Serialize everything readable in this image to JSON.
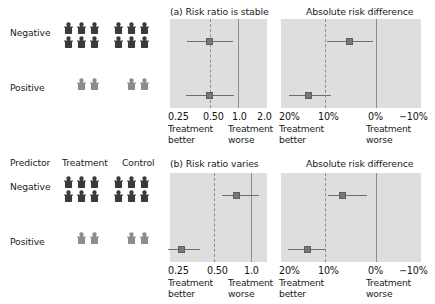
{
  "figure": {
    "icon_colors": {
      "negative": "#3a3a3a",
      "positive": "#8c8c8c"
    },
    "panel_bg": "#dedede",
    "marker_color": "#777777",
    "line_color": "#6e6e6e",
    "axis_color": "#8d8d8d"
  },
  "blocks": [
    {
      "id": "a",
      "pictogram": {
        "headers": {
          "predictor": "",
          "treatment": "",
          "control": ""
        },
        "rows": [
          {
            "label": "Negative",
            "treatment_count": 6,
            "control_count": 6,
            "tone": "negative"
          },
          {
            "label": "Positive",
            "treatment_count": 2,
            "control_count": 2,
            "tone": "positive"
          }
        ]
      },
      "charts": [
        {
          "id": "a-risk-ratio",
          "title": "(a) Risk ratio is stable",
          "ticks": [
            "0.25",
            "0.50",
            "1.0",
            "2.0"
          ],
          "footer_left": "Treatment\nbetter",
          "footer_right": "Treatment\nworse",
          "points": [
            {
              "row": "Negative",
              "estimate": 0.47,
              "low": 0.34,
              "high": 0.67
            },
            {
              "row": "Positive",
              "estimate": 0.47,
              "low": 0.33,
              "high": 0.68
            }
          ]
        },
        {
          "id": "a-risk-difference",
          "title": "Absolute risk difference",
          "ticks": [
            "20%",
            "10%",
            "0%",
            "−10%"
          ],
          "footer_left": "Treatment\nbetter",
          "footer_right": "Treatment\nworse",
          "points": [
            {
              "row": "Negative",
              "estimate": 6.0,
              "low": 10.2,
              "high": 2.2
            },
            {
              "row": "Positive",
              "estimate": 16.5,
              "low": 20.5,
              "high": 12.6
            }
          ]
        }
      ]
    },
    {
      "id": "b",
      "pictogram": {
        "headers": {
          "predictor": "Predictor",
          "treatment": "Treatment",
          "control": "Control"
        },
        "rows": [
          {
            "label": "Negative",
            "treatment_count": 6,
            "control_count": 6,
            "tone": "negative"
          },
          {
            "label": "Positive",
            "treatment_count": 2,
            "control_count": 2,
            "tone": "positive"
          }
        ]
      },
      "charts": [
        {
          "id": "b-risk-ratio",
          "title": "(b) Risk ratio varies",
          "ticks": [
            "0.25",
            "0.50",
            "1.0"
          ],
          "footer_left": "Treatment\nbetter",
          "footer_right": "Treatment\nworse",
          "points": [
            {
              "row": "Negative",
              "estimate": 0.68,
              "low": 0.5,
              "high": 1.02
            },
            {
              "row": "Positive",
              "estimate": 0.28,
              "low": 0.21,
              "high": 0.38
            }
          ]
        },
        {
          "id": "b-risk-difference",
          "title": "Absolute risk difference",
          "ticks": [
            "20%",
            "10%",
            "0%",
            "−10%"
          ],
          "footer_left": "Treatment\nbetter",
          "footer_right": "Treatment\nworse",
          "points": [
            {
              "row": "Negative",
              "estimate": 7.8,
              "low": 10.4,
              "high": 4.8
            },
            {
              "row": "Positive",
              "estimate": 16.0,
              "low": 20.6,
              "high": 10.6
            }
          ]
        }
      ]
    }
  ],
  "chart_data": {
    "type": "scatter",
    "panels": [
      {
        "panel": "a",
        "panel_title": "(a) Risk ratio is stable",
        "charts": [
          {
            "name": "Risk ratio",
            "xlabel": "Risk ratio",
            "xscale": "log",
            "xticks": [
              0.25,
              0.5,
              1.0,
              2.0
            ],
            "xticklabels": [
              "0.25",
              "0.50",
              "1.0",
              "2.0"
            ],
            "xlim": [
              0.2,
              2.5
            ],
            "reference_line": 1.0,
            "dashed_line": 0.5,
            "direction_left": "Treatment better",
            "direction_right": "Treatment worse",
            "categories": [
              "Negative",
              "Positive"
            ],
            "estimates": [
              0.47,
              0.47
            ],
            "ci_low": [
              0.34,
              0.33
            ],
            "ci_high": [
              0.67,
              0.68
            ]
          },
          {
            "name": "Absolute risk difference",
            "xlabel": "Absolute risk difference",
            "xscale": "linear-reversed",
            "xticks": [
              20,
              10,
              0,
              -10
            ],
            "xticklabels": [
              "20%",
              "10%",
              "0%",
              "−10%"
            ],
            "xlim": [
              23,
              -13
            ],
            "reference_line": 0,
            "dashed_line": 11,
            "direction_left": "Treatment better",
            "direction_right": "Treatment worse",
            "categories": [
              "Negative",
              "Positive"
            ],
            "estimates": [
              6.0,
              16.5
            ],
            "ci_low": [
              10.2,
              20.5
            ],
            "ci_high": [
              2.2,
              12.6
            ]
          }
        ]
      },
      {
        "panel": "b",
        "panel_title": "(b) Risk ratio varies",
        "charts": [
          {
            "name": "Risk ratio",
            "xlabel": "Risk ratio",
            "xscale": "log",
            "xticks": [
              0.25,
              0.5,
              1.0
            ],
            "xticklabels": [
              "0.25",
              "0.50",
              "1.0"
            ],
            "xlim": [
              0.2,
              1.3
            ],
            "reference_line": 1.0,
            "dashed_line": 0.43,
            "direction_left": "Treatment better",
            "direction_right": "Treatment worse",
            "categories": [
              "Negative",
              "Positive"
            ],
            "estimates": [
              0.68,
              0.28
            ],
            "ci_low": [
              0.5,
              0.21
            ],
            "ci_high": [
              1.02,
              0.38
            ]
          },
          {
            "name": "Absolute risk difference",
            "xlabel": "Absolute risk difference",
            "xscale": "linear-reversed",
            "xticks": [
              20,
              10,
              0,
              -10
            ],
            "xticklabels": [
              "20%",
              "10%",
              "0%",
              "−10%"
            ],
            "xlim": [
              23,
              -13
            ],
            "reference_line": 0,
            "dashed_line": 11,
            "direction_left": "Treatment better",
            "direction_right": "Treatment worse",
            "categories": [
              "Negative",
              "Positive"
            ],
            "estimates": [
              7.8,
              16.0
            ],
            "ci_low": [
              10.4,
              20.6
            ],
            "ci_high": [
              4.8,
              10.6
            ]
          }
        ]
      }
    ],
    "legend": [],
    "grid": false
  }
}
